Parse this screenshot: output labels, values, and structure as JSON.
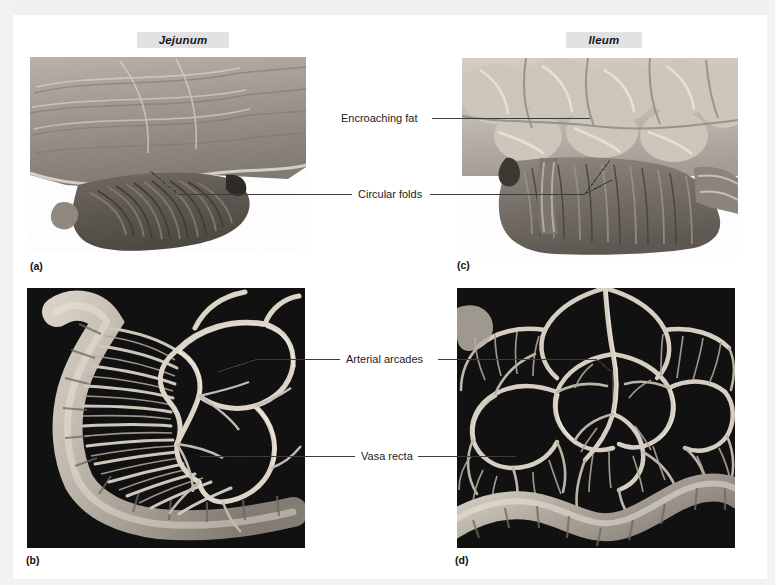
{
  "figure": {
    "type": "anatomy-photo-plate",
    "background_color": "#ffffff",
    "panel_headers": [
      {
        "id": "jejunum",
        "text": "Jejunum"
      },
      {
        "id": "ileum",
        "text": "Ileum"
      }
    ],
    "panels": [
      {
        "letter": "(a)",
        "region": "Jejunum",
        "view": "opened lumen showing mucosa",
        "background": "pale tissue on white"
      },
      {
        "letter": "(b)",
        "region": "Jejunum",
        "view": "mesentery with vessels",
        "background": "black"
      },
      {
        "letter": "(c)",
        "region": "Ileum",
        "view": "opened lumen with fat",
        "background": "pale tissue on white"
      },
      {
        "letter": "(d)",
        "region": "Ileum",
        "view": "mesentery with vessels",
        "background": "black"
      }
    ],
    "callouts": [
      {
        "id": "encroaching-fat",
        "text": "Encroaching fat",
        "points_to": [
          "c"
        ]
      },
      {
        "id": "circular-folds",
        "text": "Circular folds",
        "points_to": [
          "a",
          "c"
        ]
      },
      {
        "id": "arterial-arcades",
        "text": "Arterial arcades",
        "points_to": [
          "b",
          "d"
        ]
      },
      {
        "id": "vasa-recta",
        "text": "Vasa recta",
        "points_to": [
          "b",
          "d"
        ]
      }
    ],
    "colors": {
      "label_box": "#e2e2e2",
      "leader_line": "#3c3c3c",
      "text": "#1b1b1b",
      "mesentery_background": "#0a0a0a",
      "tissue_light": "#c8c2ba",
      "tissue_mid": "#948d85",
      "tissue_dark": "#5d5750"
    }
  }
}
